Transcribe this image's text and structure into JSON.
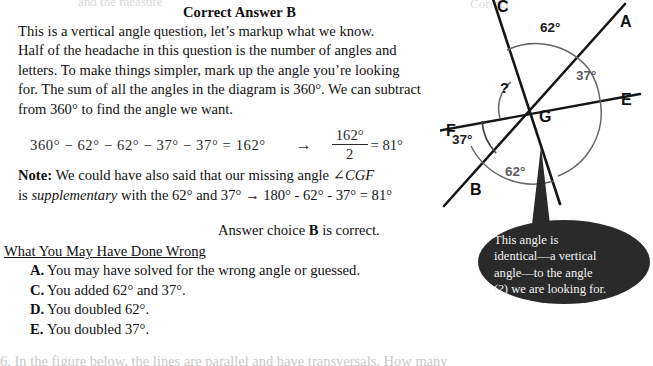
{
  "header": {
    "correct_answer": "Correct Answer B"
  },
  "explanation": {
    "lines": [
      "This is a vertical angle question, let’s markup what we know.",
      "Half of the headache in this question is the number of angles and",
      "letters. To make things simpler, mark up the angle you’re looking",
      "for.  The sum of all the angles in the diagram is 360°.  We can subtract",
      "from 360° to find the angle we want."
    ]
  },
  "equation": {
    "left": "360° − 62° − 62° − 37° − 37° = 162°",
    "arrow": "→",
    "numerator": "162°",
    "denominator": "2",
    "result": "= 81°"
  },
  "note": {
    "label": "Note:",
    "line1_rest": "  We could have also said that our missing angle ∠",
    "angle_name": "CGF",
    "line2_a": "is ",
    "line2_italic": "supplementary",
    "line2_b": " with the 62° and 37° → 180° - 62° - 37° = 81°"
  },
  "answer_choice": {
    "prefix": "Answer choice ",
    "letter": "B",
    "suffix": " is correct."
  },
  "wrong_section": {
    "heading": "What You May Have Done Wrong",
    "items": [
      {
        "label": "A.",
        "text": "You may have solved for the wrong angle or guessed."
      },
      {
        "label": "C.",
        "text": "You added 62° and 37°."
      },
      {
        "label": "D.",
        "text": "You doubled 62°."
      },
      {
        "label": "E.",
        "text": "You doubled 37°."
      }
    ]
  },
  "diagram": {
    "vertex_label": "G",
    "ray_labels": {
      "C": "C",
      "A": "A",
      "E": "E",
      "B": "B",
      "F": "F"
    },
    "angles": {
      "top": "62°",
      "right": "37°",
      "unknown": "?",
      "left": "37°",
      "bottom": "62°"
    }
  },
  "callout": {
    "lines": [
      "This angle is",
      "identical—a vertical",
      "angle—to the angle",
      "(?) we are looking for."
    ]
  },
  "cut_text": {
    "top_left": "and the measure",
    "top_right": "Correct",
    "bottom": "6. In the figure below, the lines are parallel and have transversals. How many"
  },
  "colors": {
    "text": "#111111",
    "callout_bg": "#2a2a2a",
    "callout_text": "#f2f2f2",
    "arc_grey": "#5c5c5c"
  }
}
